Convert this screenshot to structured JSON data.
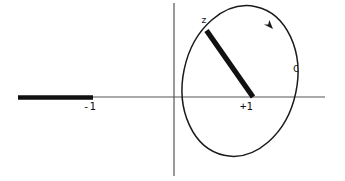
{
  "figure": {
    "kind": "complex-plane-contour-diagram",
    "width": 345,
    "height": 181,
    "background_color": "#ffffff",
    "stroke_color": "#1a1a1a",
    "axis_color": "#555555",
    "labels": {
      "branch_point_left": "-1",
      "branch_point_right": "+1",
      "point_z": "z",
      "contour": "C"
    },
    "elements": {
      "real_axis": {
        "name": "horizontal-axis",
        "x1": 18,
        "y1": 97,
        "x2": 325,
        "y2": 97,
        "stroke_width": 1
      },
      "imaginary_axis": {
        "name": "vertical-axis",
        "x1": 174,
        "y1": 3,
        "x2": 174,
        "y2": 176,
        "stroke_width": 1
      },
      "branch_cut": {
        "name": "branch-cut-segment",
        "x1": 18,
        "y1": 97,
        "x2": 93,
        "y2": 97,
        "stroke_width": 4.5,
        "description": "thick cut from minus infinity to -1"
      },
      "z_segment": {
        "name": "z-vector-segment",
        "x1": 206,
        "y1": 30,
        "x2": 253,
        "y2": 97,
        "stroke_width": 5,
        "description": "thick segment from z down to +1"
      },
      "contour_ellipse": {
        "name": "contour-c-ellipse",
        "cx": 240,
        "cy": 81,
        "rx": 57,
        "ry": 76,
        "rotation_deg": 12,
        "stroke_width": 1.4,
        "orientation": "clockwise"
      },
      "arrowhead": {
        "name": "contour-direction-arrowhead",
        "x": 269,
        "y": 27,
        "angle_deg": 55,
        "size": 9
      }
    }
  }
}
